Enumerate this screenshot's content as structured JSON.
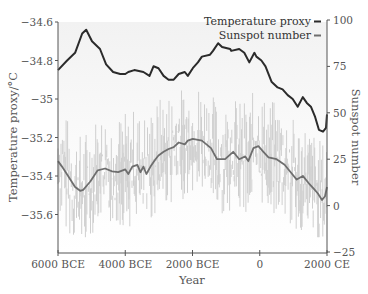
{
  "chart_data": {
    "type": "line",
    "title": "",
    "xlabel": "Year",
    "ylabel_left": "Temperature proxy/°C",
    "ylabel_right": "Sunspot number",
    "x_ticks": [
      "6000 BCE",
      "4000 BCE",
      "2000 BCE",
      "0",
      "2000 CE"
    ],
    "x_tick_values": [
      -6000,
      -4000,
      -2000,
      0,
      2000
    ],
    "xlim": [
      -6000,
      2000
    ],
    "y_left_ticks": [
      "-34.6",
      "-34.8",
      "-35",
      "-35.2",
      "-35.4",
      "-35.6"
    ],
    "y_left_tick_values": [
      -34.6,
      -34.8,
      -35.0,
      -35.2,
      -35.4,
      -35.6
    ],
    "ylim_left": [
      -35.8,
      -34.6
    ],
    "y_right_ticks": [
      "100",
      "75",
      "50",
      "25",
      "0",
      "−25"
    ],
    "y_right_tick_values": [
      100,
      75,
      50,
      25,
      0,
      -25
    ],
    "ylim_right": [
      -25,
      100
    ],
    "grid": false,
    "legend_position": "top-right",
    "legend": [
      {
        "label": "Temperature proxy",
        "color": "#2b2b2b"
      },
      {
        "label": "Sunspot number",
        "color": "#6e6e6e"
      }
    ],
    "series": [
      {
        "name": "Temperature proxy",
        "axis": "left",
        "color": "#2b2b2b",
        "x": [
          -6000,
          -5730,
          -5490,
          -5280,
          -5160,
          -4990,
          -4750,
          -4570,
          -4360,
          -4150,
          -4000,
          -3910,
          -3730,
          -3460,
          -3280,
          -3160,
          -3010,
          -2860,
          -2710,
          -2560,
          -2410,
          -2230,
          -2140,
          -1990,
          -1840,
          -1720,
          -1480,
          -1390,
          -1240,
          -1120,
          -880,
          -850,
          -610,
          -460,
          -310,
          -160,
          -100,
          50,
          170,
          350,
          530,
          680,
          830,
          980,
          1130,
          1280,
          1400,
          1520,
          1640,
          1760,
          1880,
          1970,
          2000
        ],
        "values": [
          -34.85,
          -34.8,
          -34.76,
          -34.66,
          -34.64,
          -34.7,
          -34.74,
          -34.82,
          -34.86,
          -34.87,
          -34.87,
          -34.86,
          -34.85,
          -34.86,
          -34.88,
          -34.83,
          -34.84,
          -34.88,
          -34.9,
          -34.9,
          -34.87,
          -34.86,
          -34.88,
          -34.84,
          -34.81,
          -34.78,
          -34.77,
          -34.75,
          -34.71,
          -34.73,
          -34.74,
          -34.75,
          -34.74,
          -34.76,
          -34.81,
          -34.76,
          -34.78,
          -34.8,
          -34.83,
          -34.91,
          -34.94,
          -34.95,
          -34.98,
          -35.0,
          -35.04,
          -34.99,
          -35.02,
          -35.04,
          -35.09,
          -35.16,
          -35.17,
          -35.15,
          -35.08
        ]
      },
      {
        "name": "Sunspot number (smoothed)",
        "axis": "right",
        "color": "#6e6e6e",
        "x": [
          -6000,
          -5880,
          -5700,
          -5490,
          -5340,
          -5250,
          -5040,
          -4820,
          -4600,
          -4390,
          -4210,
          -4000,
          -3910,
          -3790,
          -3640,
          -3550,
          -3460,
          -3370,
          -3250,
          -3100,
          -3010,
          -2860,
          -2710,
          -2560,
          -2410,
          -2230,
          -2140,
          -1990,
          -1720,
          -1450,
          -1270,
          -1030,
          -790,
          -610,
          -430,
          -340,
          -190,
          -40,
          110,
          260,
          500,
          740,
          920,
          1100,
          1280,
          1460,
          1610,
          1730,
          1850,
          1940,
          2000
        ],
        "values": [
          24,
          21,
          16,
          10,
          8,
          8.5,
          13,
          19,
          20,
          18.5,
          18,
          19.5,
          17,
          21,
          22,
          18,
          21,
          17,
          21,
          25,
          27,
          29,
          30.5,
          31.5,
          34,
          33,
          35,
          36,
          35,
          31,
          25,
          25,
          29,
          25,
          26.5,
          24,
          31,
          32,
          29,
          26,
          25,
          22,
          18,
          14,
          16,
          12,
          9,
          6.5,
          3,
          5,
          10
        ]
      },
      {
        "name": "Sunspot number (raw)",
        "axis": "right",
        "color": "#d4d4d4",
        "note": "high-frequency noisy series oscillating roughly ±25 around smoothed curve",
        "values_range": [
          -18,
          60
        ]
      }
    ]
  },
  "layout": {
    "plot": {
      "left": 58,
      "right": 327,
      "top": 22,
      "bottom": 253
    },
    "colors": {
      "temperature": "#2b2b2b",
      "sunspot_smooth": "#6e6e6e",
      "sunspot_raw": "#cfcfcf",
      "axis": "#555555",
      "plot_bg_top": "#f4f4f4"
    }
  }
}
